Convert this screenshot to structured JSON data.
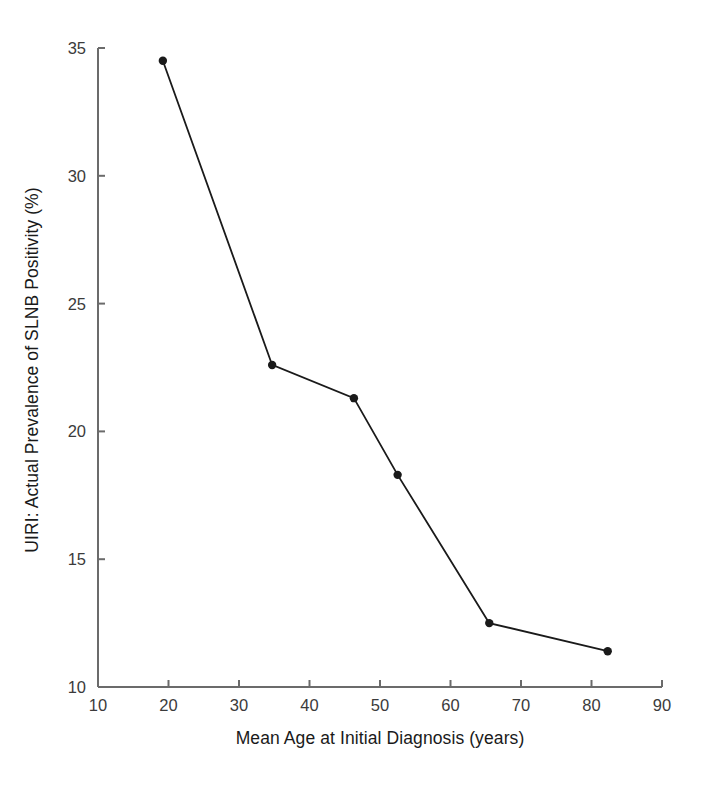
{
  "chart_data": {
    "type": "line",
    "title": "",
    "xlabel": "Mean Age at Initial Diagnosis (years)",
    "ylabel": "UIRI: Actual Prevalence of SLNB Positivity (%)",
    "xlim": [
      10,
      90
    ],
    "ylim": [
      10,
      35
    ],
    "xticks": [
      10,
      20,
      30,
      40,
      50,
      60,
      70,
      80,
      90
    ],
    "yticks": [
      10,
      15,
      20,
      25,
      30,
      35
    ],
    "xtick_labels": [
      "10",
      "20",
      "30",
      "40",
      "50",
      "60",
      "70",
      "80",
      "90"
    ],
    "ytick_labels": [
      "10",
      "15",
      "20",
      "25",
      "30",
      "35"
    ],
    "grid": false,
    "legend": null,
    "series": [
      {
        "name": "UIRI: Actual Prevalence of SLNB Positivity",
        "marker": "filled-circle",
        "color": "#1a1a1a",
        "x": [
          19.2,
          34.7,
          46.3,
          52.5,
          65.5,
          82.3
        ],
        "y": [
          34.5,
          22.6,
          21.3,
          18.3,
          12.5,
          11.4
        ]
      }
    ]
  },
  "axes": {
    "x_axis_label": "Mean Age at Initial Diagnosis (years)",
    "y_axis_label": "UIRI: Actual Prevalence of SLNB Positivity (%)",
    "axis_color": "#6b6b6b"
  }
}
